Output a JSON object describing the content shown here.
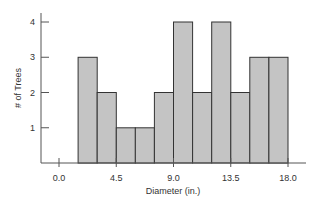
{
  "chart_data": {
    "type": "bar",
    "subtype": "histogram",
    "title": "",
    "xlabel": "Diameter (in.)",
    "ylabel": "# of Trees",
    "bin_width": 1.5,
    "bins": [
      {
        "start": 1.5,
        "end": 3.0,
        "count": 3
      },
      {
        "start": 3.0,
        "end": 4.5,
        "count": 2
      },
      {
        "start": 4.5,
        "end": 6.0,
        "count": 1
      },
      {
        "start": 6.0,
        "end": 7.5,
        "count": 1
      },
      {
        "start": 7.5,
        "end": 9.0,
        "count": 2
      },
      {
        "start": 9.0,
        "end": 10.5,
        "count": 4
      },
      {
        "start": 10.5,
        "end": 12.0,
        "count": 2
      },
      {
        "start": 12.0,
        "end": 13.5,
        "count": 4
      },
      {
        "start": 13.5,
        "end": 15.0,
        "count": 2
      },
      {
        "start": 15.0,
        "end": 16.5,
        "count": 3
      },
      {
        "start": 16.5,
        "end": 18.0,
        "count": 3
      }
    ],
    "categories": [
      "1.5-3.0",
      "3.0-4.5",
      "4.5-6.0",
      "6.0-7.5",
      "7.5-9.0",
      "9.0-10.5",
      "10.5-12.0",
      "12.0-13.5",
      "13.5-15.0",
      "15.0-16.5",
      "16.5-18.0"
    ],
    "values": [
      3,
      2,
      1,
      1,
      2,
      4,
      2,
      4,
      2,
      3,
      3
    ],
    "x_ticks": [
      "0.0",
      "4.5",
      "9.0",
      "13.5",
      "18.0"
    ],
    "x_tick_values": [
      0.0,
      4.5,
      9.0,
      13.5,
      18.0
    ],
    "y_ticks": [
      "1",
      "2",
      "3",
      "4"
    ],
    "y_tick_values": [
      1,
      2,
      3,
      4
    ],
    "xlim": [
      -1.4,
      19.4
    ],
    "ylim": [
      0,
      4.3
    ],
    "grid": false,
    "legend": null,
    "colors": {
      "bar_fill": "#c4c4c4",
      "bar_stroke": "#333333",
      "axis": "#555555"
    }
  }
}
